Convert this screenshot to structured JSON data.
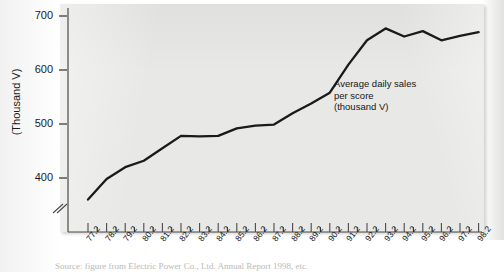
{
  "figure": {
    "background_color": "#e8e8e6",
    "line_color": "#1a1a1a",
    "axis_color": "#4a4a4a"
  },
  "annotation": {
    "line1": "Average daily sales",
    "line2": "per score",
    "line3": "(thousand V)"
  },
  "source_note": "Source: figure from Electric Power Co., Ltd. Annual Report 1998, etc.",
  "chart_data": {
    "type": "line",
    "title": "",
    "xlabel": "",
    "ylabel": "(Thousand V)",
    "ylim": [
      340,
      700
    ],
    "axis_break": true,
    "axis_break_symbol": "//",
    "grid": false,
    "legend": "none",
    "ytick_labels": [
      "700",
      "600",
      "500",
      "400"
    ],
    "ytick_values": [
      700,
      600,
      500,
      400
    ],
    "categories": [
      "77.2",
      "78.2",
      "79.2",
      "80.2",
      "81.2",
      "82.2",
      "83.2",
      "84.2",
      "85.2",
      "86.2",
      "87.2",
      "88.2",
      "89.2",
      "90.2",
      "91.2",
      "92.2",
      "93.2",
      "94.2",
      "95.2",
      "96.2",
      "97.2",
      "98.2"
    ],
    "values": [
      360,
      398,
      420,
      432,
      455,
      478,
      477,
      478,
      492,
      497,
      499,
      520,
      538,
      558,
      610,
      655,
      677,
      662,
      672,
      655,
      663,
      670
    ],
    "series": [
      {
        "name": "Average daily sales per score (thousand V)",
        "values": [
          360,
          398,
          420,
          432,
          455,
          478,
          477,
          478,
          492,
          497,
          499,
          520,
          538,
          558,
          610,
          655,
          677,
          662,
          672,
          655,
          663,
          670
        ]
      }
    ]
  }
}
